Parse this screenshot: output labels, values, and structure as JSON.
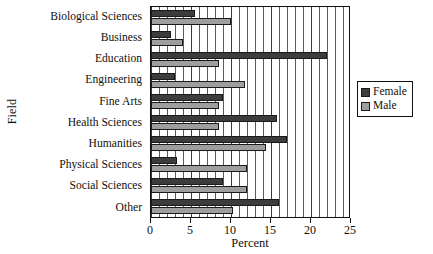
{
  "chart_data": {
    "type": "bar",
    "orientation": "horizontal",
    "title": "",
    "xlabel": "Percent",
    "ylabel": "Field",
    "xlim": [
      0,
      25
    ],
    "xticks": [
      0,
      5,
      10,
      15,
      20,
      25
    ],
    "xtick_labels": [
      "0",
      "5",
      "10",
      "15",
      "20",
      "25"
    ],
    "grid": true,
    "grid_axis": "x",
    "grid_minor_step": 1,
    "legend_position": "right",
    "categories": [
      "Biological Sciences",
      "Business",
      "Education",
      "Engineering",
      "Fine Arts",
      "Health Sciences",
      "Humanities",
      "Physical Sciences",
      "Social Sciences",
      "Other"
    ],
    "series": [
      {
        "name": "Female",
        "color": "#3c3c3c",
        "values": [
          5.5,
          2.5,
          22.0,
          3.0,
          9.0,
          15.8,
          17.0,
          3.2,
          9.0,
          16.0
        ]
      },
      {
        "name": "Male",
        "color": "#9e9e9e",
        "values": [
          10.0,
          4.0,
          8.5,
          11.8,
          8.5,
          8.5,
          14.4,
          12.0,
          12.0,
          10.2
        ]
      }
    ]
  },
  "legend": {
    "entries": [
      {
        "label": "Female",
        "swatch": "female-swatch"
      },
      {
        "label": "Male",
        "swatch": "male-swatch"
      }
    ]
  },
  "colors": {
    "female": "#3c3c3c",
    "male": "#9e9e9e",
    "axis": "#111111",
    "grid": "#5a5a5a",
    "background": "#ffffff"
  }
}
